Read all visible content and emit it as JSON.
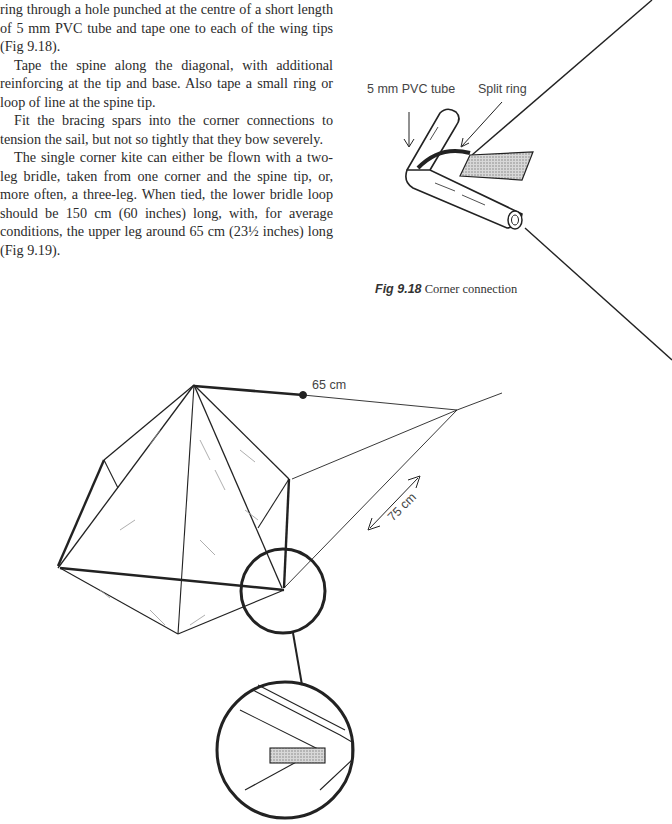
{
  "text": {
    "paragraphs": [
      {
        "indent": false,
        "text": "ring through a hole punched at the centre of a short length of 5 mm PVC tube and tape one to each of the wing tips (Fig 9.18)."
      },
      {
        "indent": true,
        "text": "Tape the spine along the diagonal, with additional reinforcing at the tip and base. Also tape a small ring or loop of line at the spine tip."
      },
      {
        "indent": true,
        "text": "Fit the bracing spars into the corner connections to tension the sail, but not so tightly that they bow severely."
      },
      {
        "indent": true,
        "text": "The single corner kite can either be flown with a two-leg bridle, taken from one corner and the spine tip, or, more often, a three-leg. When tied, the lower bridle loop should be 150 cm (60 inches) long, with, for average conditions, the upper leg around 65 cm (23½ inches) long (Fig 9.19)."
      }
    ]
  },
  "figure_9_18": {
    "label_tube": "5 mm PVC tube",
    "label_ring": "Split ring",
    "caption_number": "Fig 9.18",
    "caption_text": "Corner connection"
  },
  "figure_9_19": {
    "label_upper_leg": "65 cm",
    "label_lower_loop": "75 cm"
  }
}
